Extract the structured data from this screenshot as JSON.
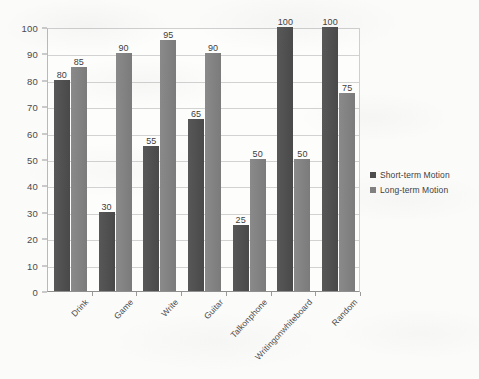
{
  "chart_data": {
    "type": "bar",
    "title": "",
    "xlabel": "",
    "ylabel": "",
    "ylim": [
      0,
      100
    ],
    "ytick_step": 10,
    "yticks": [
      100,
      90,
      80,
      70,
      60,
      50,
      40,
      30,
      20,
      10,
      0
    ],
    "grid": true,
    "legend_position": "right",
    "categories": [
      "Drink",
      "Game",
      "Write",
      "Guitar",
      "Talkonphone",
      "Writingonwhiteboard",
      "Random"
    ],
    "series": [
      {
        "name": "Short-term Motion",
        "color": "#4d4d4d",
        "values": [
          80,
          30,
          55,
          65,
          25,
          100,
          100
        ]
      },
      {
        "name": "Long-term Motion",
        "color": "#808080",
        "values": [
          85,
          90,
          95,
          90,
          50,
          50,
          75
        ]
      }
    ],
    "data_labels": [
      [
        "80",
        "30",
        "55",
        "65",
        "25",
        "100",
        "100"
      ],
      [
        "85",
        "90",
        "95",
        "90",
        "50",
        "50",
        "75"
      ]
    ]
  },
  "legend": {
    "items": [
      {
        "label": "Short-term Motion",
        "swatch": "short"
      },
      {
        "label": "Long-term Motion",
        "swatch": "long"
      }
    ]
  }
}
